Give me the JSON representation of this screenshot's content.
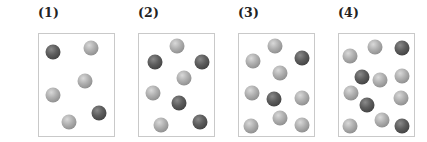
{
  "colors": {
    "light_ball": "#a8a8a8",
    "dark_ball": "#4a4a4a",
    "box_border": "#c9c9c9"
  },
  "panels": [
    {
      "label": "(1)",
      "x": 30,
      "balls": [
        {
          "type": "dark",
          "x": 14,
          "y": 18
        },
        {
          "type": "light",
          "x": 52,
          "y": 14
        },
        {
          "type": "light",
          "x": 46,
          "y": 47
        },
        {
          "type": "light",
          "x": 14,
          "y": 61
        },
        {
          "type": "dark",
          "x": 60,
          "y": 79
        },
        {
          "type": "light",
          "x": 30,
          "y": 88
        }
      ]
    },
    {
      "label": "(2)",
      "x": 130,
      "balls": [
        {
          "type": "light",
          "x": 38,
          "y": 12
        },
        {
          "type": "dark",
          "x": 16,
          "y": 28
        },
        {
          "type": "dark",
          "x": 63,
          "y": 28
        },
        {
          "type": "light",
          "x": 45,
          "y": 44
        },
        {
          "type": "light",
          "x": 14,
          "y": 59
        },
        {
          "type": "dark",
          "x": 40,
          "y": 69
        },
        {
          "type": "light",
          "x": 22,
          "y": 91
        },
        {
          "type": "dark",
          "x": 61,
          "y": 88
        }
      ]
    },
    {
      "label": "(3)",
      "x": 230,
      "balls": [
        {
          "type": "light",
          "x": 36,
          "y": 12
        },
        {
          "type": "light",
          "x": 14,
          "y": 27
        },
        {
          "type": "dark",
          "x": 63,
          "y": 24
        },
        {
          "type": "light",
          "x": 41,
          "y": 39
        },
        {
          "type": "light",
          "x": 13,
          "y": 59
        },
        {
          "type": "dark",
          "x": 35,
          "y": 65
        },
        {
          "type": "light",
          "x": 63,
          "y": 64
        },
        {
          "type": "light",
          "x": 41,
          "y": 84
        },
        {
          "type": "light",
          "x": 12,
          "y": 92
        },
        {
          "type": "light",
          "x": 63,
          "y": 91
        }
      ]
    },
    {
      "label": "(4)",
      "x": 330,
      "balls": [
        {
          "type": "light",
          "x": 36,
          "y": 13
        },
        {
          "type": "dark",
          "x": 63,
          "y": 14
        },
        {
          "type": "light",
          "x": 11,
          "y": 22
        },
        {
          "type": "dark",
          "x": 23,
          "y": 43
        },
        {
          "type": "light",
          "x": 41,
          "y": 46
        },
        {
          "type": "light",
          "x": 63,
          "y": 42
        },
        {
          "type": "light",
          "x": 12,
          "y": 59
        },
        {
          "type": "dark",
          "x": 28,
          "y": 71
        },
        {
          "type": "light",
          "x": 62,
          "y": 64
        },
        {
          "type": "light",
          "x": 43,
          "y": 86
        },
        {
          "type": "light",
          "x": 11,
          "y": 92
        },
        {
          "type": "dark",
          "x": 63,
          "y": 92
        }
      ]
    }
  ]
}
